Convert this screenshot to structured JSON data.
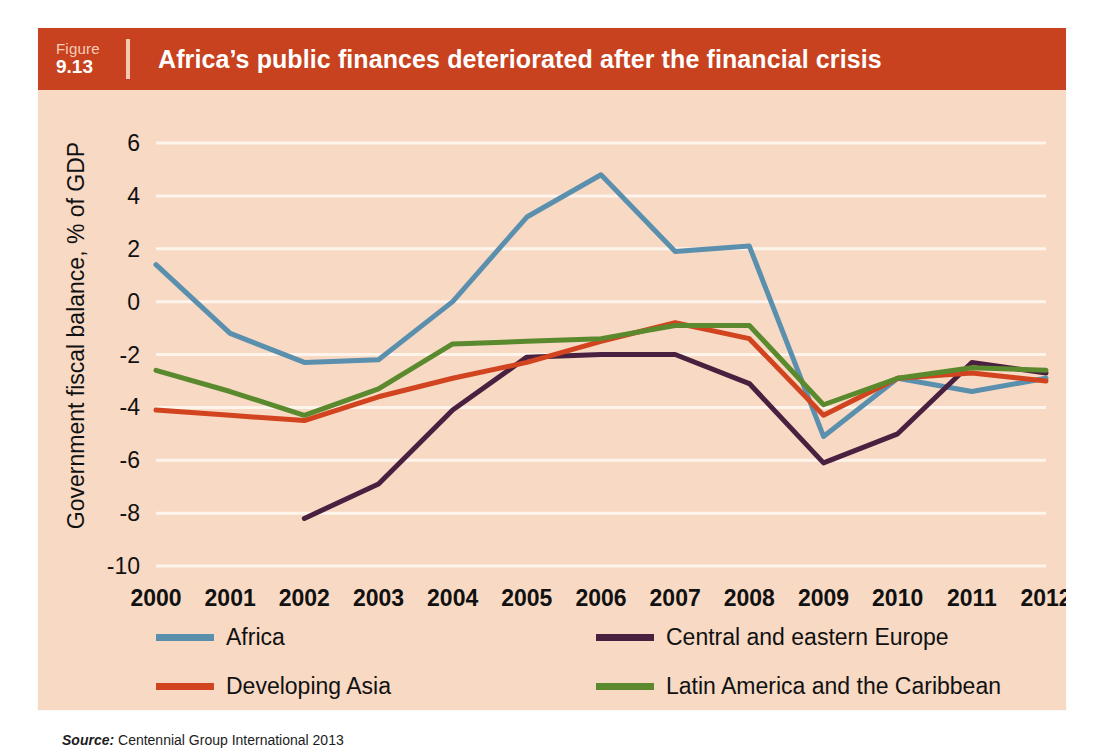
{
  "figure": {
    "label_word": "Figure",
    "number": "9.13",
    "title": "Africa’s public finances deteriorated after the financial crisis",
    "source_prefix": "Source:",
    "source_text": "Centennial Group International 2013"
  },
  "colors": {
    "banner": "#c8421f",
    "panel_background": "#f7d9c4",
    "gridline": "#fdf4ec",
    "africa": "#5b8fae",
    "central_and_eastern_europe": "#4a2040",
    "developing_asia": "#d1441f",
    "latin_america_and_the_caribbean": "#5a8a2d"
  },
  "chart_data": {
    "type": "line",
    "title": "Africa’s public finances deteriorated after the financial crisis",
    "xlabel": "",
    "ylabel": "Government fiscal balance,  % of GDP",
    "x": [
      "2000",
      "2001",
      "2002",
      "2003",
      "2004",
      "2005",
      "2006",
      "2007",
      "2008",
      "2009",
      "2010",
      "2011",
      "2012"
    ],
    "ylim": [
      -10,
      6
    ],
    "yticks": [
      6,
      4,
      2,
      0,
      -2,
      -4,
      -6,
      -8,
      -10
    ],
    "ytick_labels": [
      "6",
      "4",
      "2",
      "0",
      "-2",
      "-4",
      "-6",
      "-8",
      "-10"
    ],
    "grid": true,
    "legend_position": "below",
    "series": [
      {
        "name": "Africa",
        "color": "#5b8fae",
        "values": [
          1.4,
          -1.2,
          -2.3,
          -2.2,
          0.0,
          3.2,
          4.8,
          1.9,
          2.1,
          -5.1,
          -2.9,
          -3.4,
          -2.9
        ]
      },
      {
        "name": "Central and eastern Europe",
        "color": "#4a2040",
        "values": [
          null,
          null,
          -8.2,
          -6.9,
          -4.1,
          -2.1,
          -2.0,
          -2.0,
          -3.1,
          -6.1,
          -5.0,
          -2.3,
          -2.7
        ]
      },
      {
        "name": "Developing Asia",
        "color": "#d1441f",
        "values": [
          -4.1,
          -4.3,
          -4.5,
          -3.6,
          -2.9,
          -2.3,
          -1.5,
          -0.8,
          -1.4,
          -4.3,
          -2.9,
          -2.7,
          -3.0
        ]
      },
      {
        "name": "Latin America and the Caribbean",
        "color": "#5a8a2d",
        "values": [
          -2.6,
          -3.4,
          -4.3,
          -3.3,
          -1.6,
          -1.5,
          -1.4,
          -0.9,
          -0.9,
          -3.9,
          -2.9,
          -2.5,
          -2.6
        ]
      }
    ]
  }
}
